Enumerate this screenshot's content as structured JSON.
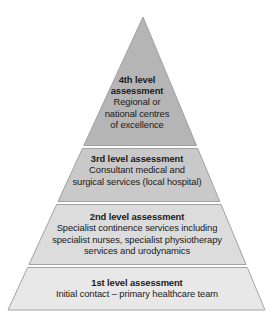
{
  "figure": {
    "type": "pyramid-diagram",
    "shape": "triangle",
    "orientation": "apex-up",
    "level_count": 4,
    "background_color": "#ffffff",
    "outline_color": "#9a9a9a"
  },
  "levels": [
    {
      "id": "level-4",
      "position_from_top": 1,
      "title": "4th level\nassessment",
      "description": "Regional or\nnational centres\nof excellence",
      "fill_color": "#b5b5b5"
    },
    {
      "id": "level-3",
      "position_from_top": 2,
      "title": "3rd level assessment",
      "description": "Consultant medical and\nsurgical services (local hospital)",
      "fill_color": "#c9c9c9"
    },
    {
      "id": "level-2",
      "position_from_top": 3,
      "title": "2nd level assessment",
      "description": "Specialist continence services including\nspecialist nurses, specialist physiotherapy\nservices and urodynamics",
      "fill_color": "#dcdcdc"
    },
    {
      "id": "level-1",
      "position_from_top": 4,
      "title": "1st level assessment",
      "description": "Initial contact – primary healthcare team",
      "fill_color": "#e8e8e8"
    }
  ]
}
